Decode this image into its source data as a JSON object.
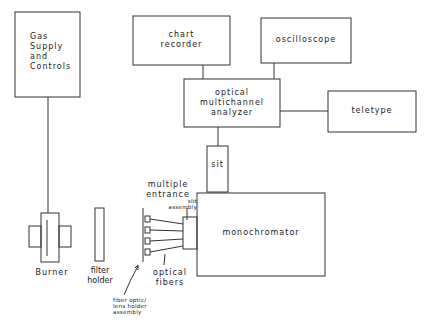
{
  "diagram": {
    "type": "block-diagram",
    "nodes": {
      "gas_supply": {
        "label_lines": [
          "Gas",
          "Supply",
          "and",
          "Controls"
        ]
      },
      "chart_recorder": {
        "label_lines": [
          "chart",
          "recorder"
        ]
      },
      "oscilloscope": {
        "label": "oscilloscope"
      },
      "oma": {
        "label_lines": [
          "optical",
          "multichannel",
          "analyzer"
        ]
      },
      "teletype": {
        "label": "teletype"
      },
      "sit": {
        "label": "sit"
      },
      "monochromator": {
        "label": "monochromator"
      },
      "burner": {
        "label": "Burner"
      },
      "filter_holder": {
        "label_lines": [
          "filter",
          "holder"
        ]
      },
      "slit_assembly": {
        "label_lines": [
          "multiple",
          "entrance"
        ],
        "sub_label_lines": [
          "slit",
          "assembly"
        ]
      },
      "optical_fibers": {
        "label_lines": [
          "optical",
          "fibers"
        ]
      },
      "fiber_optic_holder": {
        "label_lines": [
          "fiber optic/",
          "lens holder",
          "assembly"
        ]
      }
    },
    "edges": [
      [
        "gas_supply",
        "burner"
      ],
      [
        "chart_recorder",
        "oma"
      ],
      [
        "oscilloscope",
        "oma"
      ],
      [
        "oma",
        "teletype"
      ],
      [
        "oma",
        "sit"
      ],
      [
        "sit",
        "monochromator"
      ],
      [
        "fiber_optic_holder",
        "slit_assembly"
      ],
      [
        "slit_assembly",
        "monochromator"
      ]
    ]
  }
}
